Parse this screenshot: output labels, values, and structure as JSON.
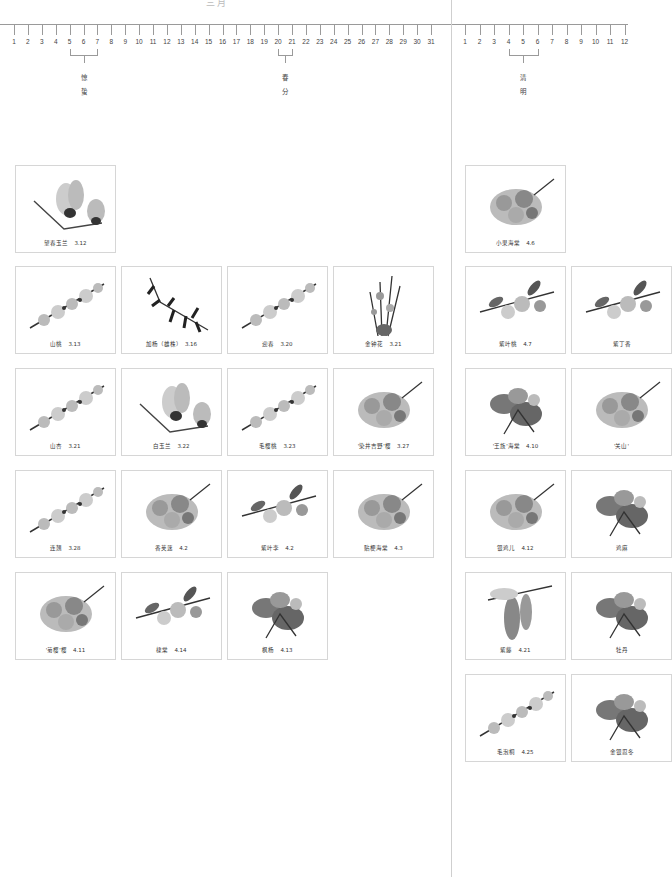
{
  "page": {
    "top_title_partial": "三月",
    "colors": {
      "line": "#9a9a9a",
      "card_border": "#d6d6d6",
      "text": "#333333"
    }
  },
  "timeline": {
    "march": {
      "days": [
        "1",
        "2",
        "3",
        "4",
        "5",
        "6",
        "7",
        "8",
        "9",
        "10",
        "11",
        "12",
        "13",
        "14",
        "15",
        "16",
        "17",
        "18",
        "19",
        "20",
        "21",
        "22",
        "23",
        "24",
        "25",
        "26",
        "27",
        "28",
        "29",
        "30",
        "31"
      ],
      "solar_terms": [
        {
          "name": "惊蛰",
          "chars": [
            "惊",
            "蛰"
          ],
          "range": [
            5,
            7
          ]
        },
        {
          "name": "春分",
          "chars": [
            "春",
            "分"
          ],
          "range": [
            20,
            21
          ]
        }
      ]
    },
    "april": {
      "days": [
        "1",
        "2",
        "3",
        "4",
        "5",
        "6",
        "7",
        "8",
        "9",
        "10",
        "11",
        "12"
      ],
      "solar_terms": [
        {
          "name": "清明",
          "chars": [
            "清",
            "明"
          ],
          "range": [
            4,
            6
          ]
        }
      ]
    }
  },
  "cards_march": [
    {
      "name": "望春玉兰",
      "date": "3.12",
      "label": "望春玉兰　3.12",
      "icon": "magnolia"
    },
    {
      "name": "山桃",
      "date": "3.13",
      "label": "山桃　3.13",
      "icon": "branch-blossom"
    },
    {
      "name": "加杨（雄株）",
      "date": "3.16",
      "label": "加杨（雄株）　3.16",
      "icon": "catkin-branch"
    },
    {
      "name": "迎春",
      "date": "3.20",
      "label": "迎春　3.20",
      "icon": "branch-blossom"
    },
    {
      "name": "金钟花",
      "date": "3.21",
      "label": "金钟花　3.21",
      "icon": "upright-stems"
    },
    {
      "name": "山杏",
      "date": "3.21",
      "label": "山杏　3.21",
      "icon": "branch-blossom"
    },
    {
      "name": "白玉兰",
      "date": "3.22",
      "label": "白玉兰　3.22",
      "icon": "magnolia"
    },
    {
      "name": "毛樱桃",
      "date": "3.23",
      "label": "毛樱桃　3.23",
      "icon": "branch-blossom"
    },
    {
      "name": "'染井吉野'樱",
      "date": "3.27",
      "label": "'染井吉野'樱　3.27",
      "icon": "blossom-cluster"
    },
    {
      "name": "连翘",
      "date": "3.28",
      "label": "连翘　3.28",
      "icon": "branch-blossom"
    },
    {
      "name": "香荚蒾",
      "date": "4.2",
      "label": "香荚蒾　4.2",
      "icon": "blossom-cluster"
    },
    {
      "name": "紫叶李",
      "date": "4.2",
      "label": "紫叶李　4.2",
      "icon": "leafy-branch"
    },
    {
      "name": "贴梗海棠",
      "date": "4.3",
      "label": "贴梗海棠　4.3",
      "icon": "blossom-cluster"
    },
    {
      "name": "'菊樱'樱",
      "date": "4.11",
      "label": "'菊樱'樱　4.11",
      "icon": "blossom-cluster"
    },
    {
      "name": "棣棠",
      "date": "4.14",
      "label": "棣棠　4.14",
      "icon": "leafy-branch"
    },
    {
      "name": "枫杨",
      "date": "4.13",
      "label": "枫杨　4.13",
      "icon": "leafy-cluster"
    }
  ],
  "cards_april": [
    {
      "name": "小果海棠",
      "date": "4.6",
      "label": "小果海棠　4.6",
      "icon": "blossom-cluster"
    },
    {
      "name": "紫叶桃",
      "date": "4.7",
      "label": "紫叶桃　4.7",
      "icon": "leafy-branch"
    },
    {
      "name": "紫丁香",
      "date": "",
      "label": "紫丁香",
      "icon": "leafy-branch"
    },
    {
      "name": "'王族'海棠",
      "date": "4.10",
      "label": "'王族'海棠　4.10",
      "icon": "leafy-cluster"
    },
    {
      "name": "'关山'",
      "date": "",
      "label": "'关山'",
      "icon": "blossom-cluster"
    },
    {
      "name": "银鸡儿",
      "date": "4.12",
      "label": "银鸡儿　4.12",
      "icon": "blossom-cluster"
    },
    {
      "name": "鸡麻",
      "date": "",
      "label": "鸡麻",
      "icon": "leafy-cluster"
    },
    {
      "name": "紫藤",
      "date": "4.21",
      "label": "紫藤　4.21",
      "icon": "hanging-raceme"
    },
    {
      "name": "牡丹",
      "date": "",
      "label": "牡丹",
      "icon": "leafy-cluster"
    },
    {
      "name": "毛泡桐",
      "date": "4.25",
      "label": "毛泡桐　4.25",
      "icon": "branch-blossom"
    },
    {
      "name": "金银忍冬",
      "date": "",
      "label": "金银忍冬",
      "icon": "leafy-cluster"
    }
  ]
}
